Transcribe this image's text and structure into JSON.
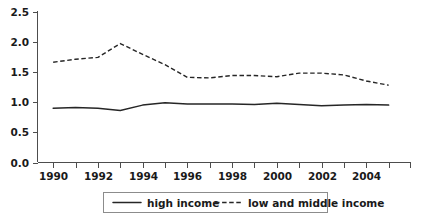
{
  "chart_data": {
    "type": "line",
    "title": "",
    "subtitle": "",
    "xlabel": "",
    "ylabel": "",
    "xlim": [
      1989.3,
      2006.0
    ],
    "ylim": [
      0.0,
      2.5
    ],
    "grid": false,
    "legend_position": "bottom",
    "x": [
      1990,
      1991,
      1992,
      1993,
      1994,
      1995,
      1996,
      1997,
      1998,
      1999,
      2000,
      2001,
      2002,
      2003,
      2004,
      2005
    ],
    "xticks": [
      1990,
      1991,
      1992,
      1993,
      1994,
      1995,
      1996,
      1997,
      1998,
      1999,
      2000,
      2001,
      2002,
      2003,
      2004,
      2005
    ],
    "xtick_labels": [
      "1990",
      "",
      "1992",
      "",
      "1994",
      "",
      "1996",
      "",
      "1998",
      "",
      "2000",
      "",
      "2002",
      "",
      "2004",
      ""
    ],
    "xtick_labels_shown": [
      "1990",
      "1992",
      "1994",
      "1996",
      "1998",
      "2000",
      "2002",
      "2004"
    ],
    "yticks": [
      0.0,
      0.5,
      1.0,
      1.5,
      2.0,
      2.5
    ],
    "ytick_labels": [
      "0.0",
      "0.5",
      "1.0",
      "1.5",
      "2.0",
      "2.5"
    ],
    "series": [
      {
        "name": "high income",
        "style": "solid",
        "color": "#262626",
        "values": [
          0.9,
          0.91,
          0.9,
          0.86,
          0.95,
          0.99,
          0.97,
          0.97,
          0.97,
          0.96,
          0.98,
          0.96,
          0.94,
          0.95,
          0.96,
          0.95
        ]
      },
      {
        "name": "low and middle income",
        "style": "dashed",
        "color": "#262626",
        "values": [
          1.66,
          1.71,
          1.74,
          1.97,
          1.79,
          1.62,
          1.41,
          1.4,
          1.44,
          1.44,
          1.42,
          1.48,
          1.48,
          1.45,
          1.35,
          1.28
        ]
      }
    ]
  },
  "legend": {
    "items": [
      {
        "label": "high income",
        "style": "solid"
      },
      {
        "label": "low and middle income",
        "style": "dashed"
      }
    ]
  },
  "colors": {
    "axis": "#4d4d4d",
    "series": "#262626",
    "legend_border": "#8c8c8c",
    "background": "#ffffff"
  }
}
